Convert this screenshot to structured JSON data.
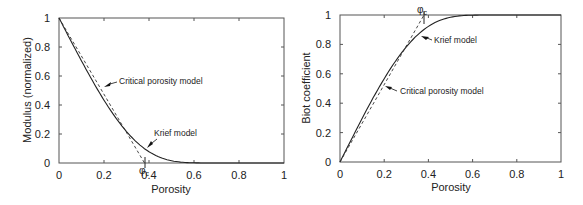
{
  "chart_data": [
    {
      "type": "line",
      "title": "",
      "xlabel": "Porosity",
      "ylabel": "Modulus  (normalized)",
      "xlim": [
        0,
        1
      ],
      "ylim": [
        0,
        1
      ],
      "xticks": [
        "0",
        "0.2",
        "0.4",
        "0.6",
        "0.8",
        "1"
      ],
      "yticks": [
        "0",
        "0.2",
        "0.4",
        "0.6",
        "0.8",
        "1"
      ],
      "grid": false,
      "legend": null,
      "series": [
        {
          "name": "Krief model",
          "style": "solid",
          "x": [
            0,
            0.05,
            0.1,
            0.15,
            0.2,
            0.25,
            0.3,
            0.35,
            0.4,
            0.45,
            0.5,
            0.55,
            0.6,
            1.0
          ],
          "y": [
            1.0,
            0.85,
            0.71,
            0.57,
            0.43,
            0.31,
            0.2,
            0.13,
            0.08,
            0.04,
            0.02,
            0.01,
            0.0,
            0.0
          ]
        },
        {
          "name": "Critical porosity model",
          "style": "dashed",
          "x": [
            0,
            0.38
          ],
          "y": [
            1.0,
            0.0
          ]
        }
      ],
      "annotations": [
        {
          "text": "Critical porosity model",
          "arrow_to": [
            0.2,
            0.52
          ]
        },
        {
          "text": "Krief model",
          "arrow_to": [
            0.39,
            0.1
          ]
        },
        {
          "text": "φc",
          "x": 0.38,
          "y": 0,
          "note": "critical porosity marker on x-axis"
        }
      ]
    },
    {
      "type": "line",
      "title": "",
      "xlabel": "Porosity",
      "ylabel": "Biot coefficient",
      "xlim": [
        0,
        1
      ],
      "ylim": [
        0,
        1
      ],
      "xticks": [
        "0",
        "0.2",
        "0.4",
        "0.6",
        "0.8",
        "1"
      ],
      "yticks": [
        "0",
        "0.2",
        "0.4",
        "0.6",
        "0.8",
        "1"
      ],
      "grid": false,
      "legend": null,
      "series": [
        {
          "name": "Krief model",
          "style": "solid",
          "x": [
            0,
            0.05,
            0.1,
            0.15,
            0.2,
            0.25,
            0.3,
            0.35,
            0.4,
            0.45,
            0.5,
            0.55,
            0.6,
            1.0
          ],
          "y": [
            0.0,
            0.15,
            0.29,
            0.43,
            0.57,
            0.69,
            0.8,
            0.87,
            0.92,
            0.96,
            0.98,
            0.99,
            1.0,
            1.0
          ]
        },
        {
          "name": "Critical porosity model",
          "style": "dashed",
          "x": [
            0,
            0.38
          ],
          "y": [
            0.0,
            1.0
          ]
        }
      ],
      "annotations": [
        {
          "text": "Krief model",
          "arrow_to": [
            0.37,
            0.88
          ]
        },
        {
          "text": "Critical porosity model",
          "arrow_to": [
            0.2,
            0.53
          ]
        },
        {
          "text": "φc",
          "x": 0.38,
          "y": 1,
          "note": "critical porosity marker on top axis"
        }
      ]
    }
  ],
  "labels": {
    "left": {
      "ylabel": "Modulus  (normalized)",
      "xlabel": "Porosity",
      "critical": "Critical porosity model",
      "krief": "Krief model",
      "phi": "φ",
      "phi_sub": "c"
    },
    "right": {
      "ylabel": "Biot coefficient",
      "xlabel": "Porosity",
      "critical": "Critical porosity model",
      "krief": "Krief model",
      "phi": "φ",
      "phi_sub": "c"
    },
    "ticks": [
      "0",
      "0.2",
      "0.4",
      "0.6",
      "0.8",
      "1"
    ]
  }
}
